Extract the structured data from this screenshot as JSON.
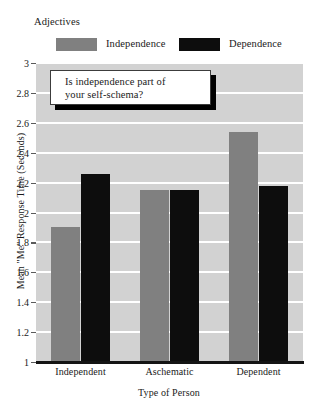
{
  "chart_data": {
    "type": "bar",
    "title": "",
    "xlabel": "Type of Person",
    "ylabel": "Mean \"Me\" Response Time (Seconds)",
    "categories": [
      "Independent",
      "Aschematic",
      "Dependent"
    ],
    "series": [
      {
        "name": "Independence",
        "color": "#808080",
        "values": [
          1.9,
          2.15,
          2.54
        ]
      },
      {
        "name": "Dependence",
        "color": "#0d0d0d",
        "values": [
          2.26,
          2.15,
          2.18
        ]
      }
    ],
    "ylim": [
      1,
      3
    ],
    "ytick_step": 0.2,
    "ytick_labels": [
      "3",
      "2.8",
      "2.6",
      "2.4",
      "2.2",
      "2",
      "1.8",
      "1.6",
      "1.4",
      "1.2",
      "1"
    ],
    "ytick_values": [
      3,
      2.8,
      2.6,
      2.4,
      2.2,
      2,
      1.8,
      1.6,
      1.4,
      1.2,
      1
    ],
    "grid": true,
    "grid_color": "#ffffff",
    "plot_background": "#d2d2d2",
    "legend_position": "above-plot"
  },
  "legend": {
    "title": "Adjectives",
    "entries": [
      {
        "label": "Independence",
        "color": "#808080"
      },
      {
        "label": "Dependence",
        "color": "#0d0d0d"
      }
    ]
  },
  "callout": {
    "line1": "Is independence part of",
    "line2": "your self-schema?"
  }
}
